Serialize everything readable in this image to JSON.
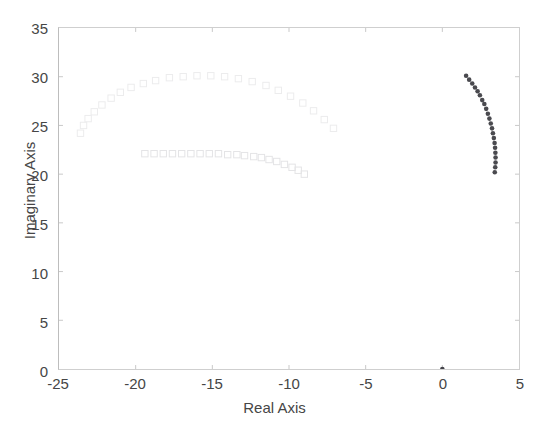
{
  "chart_data": {
    "type": "scatter",
    "title": "",
    "xlabel": "Real Axis",
    "ylabel": "Imaginary Axis",
    "xlim": [
      -25,
      5
    ],
    "ylim": [
      0,
      35
    ],
    "xticks": [
      -25,
      -20,
      -15,
      -10,
      -5,
      0,
      5
    ],
    "yticks": [
      0,
      5,
      10,
      15,
      20,
      25,
      30,
      35
    ],
    "xtick_labels": [
      "-25",
      "-20",
      "-15",
      "-10",
      "-5",
      "0",
      "5"
    ],
    "ytick_labels": [
      "0",
      "5",
      "10",
      "15",
      "20",
      "25",
      "30",
      "35"
    ],
    "grid": false,
    "legend": null,
    "background": "#ffffff",
    "frame_color": "#cfcfcf",
    "series": [
      {
        "name": "upper-locus-branch",
        "marker": "square-open",
        "color": "#ececed",
        "points": [
          [
            -23.6,
            24.2
          ],
          [
            -23.4,
            25.0
          ],
          [
            -23.1,
            25.7
          ],
          [
            -22.7,
            26.4
          ],
          [
            -22.2,
            27.1
          ],
          [
            -21.6,
            27.8
          ],
          [
            -21.0,
            28.4
          ],
          [
            -20.3,
            28.9
          ],
          [
            -19.5,
            29.3
          ],
          [
            -18.7,
            29.6
          ],
          [
            -17.8,
            29.9
          ],
          [
            -16.9,
            30.0
          ],
          [
            -16.0,
            30.1
          ],
          [
            -15.1,
            30.1
          ],
          [
            -14.2,
            30.0
          ],
          [
            -13.3,
            29.8
          ],
          [
            -12.4,
            29.5
          ],
          [
            -11.5,
            29.1
          ],
          [
            -10.7,
            28.6
          ],
          [
            -9.9,
            28.0
          ],
          [
            -9.1,
            27.3
          ],
          [
            -8.4,
            26.5
          ],
          [
            -7.7,
            25.6
          ],
          [
            -7.1,
            24.7
          ]
        ]
      },
      {
        "name": "lower-locus-branch",
        "marker": "square-open",
        "color": "#e4e4e6",
        "points": [
          [
            -19.4,
            22.1
          ],
          [
            -18.8,
            22.1
          ],
          [
            -18.2,
            22.1
          ],
          [
            -17.6,
            22.1
          ],
          [
            -17.0,
            22.1
          ],
          [
            -16.4,
            22.1
          ],
          [
            -15.8,
            22.1
          ],
          [
            -15.2,
            22.1
          ],
          [
            -14.6,
            22.1
          ],
          [
            -14.0,
            22.0
          ],
          [
            -13.4,
            22.0
          ],
          [
            -12.9,
            21.9
          ],
          [
            -12.3,
            21.8
          ],
          [
            -11.8,
            21.7
          ],
          [
            -11.3,
            21.5
          ],
          [
            -10.8,
            21.3
          ],
          [
            -10.3,
            21.0
          ],
          [
            -9.8,
            20.7
          ],
          [
            -9.4,
            20.4
          ],
          [
            -9.0,
            20.0
          ]
        ]
      },
      {
        "name": "right-locus-branch",
        "marker": "dot-filled",
        "color": "#4a4a4f",
        "points": [
          [
            1.55,
            30.1
          ],
          [
            1.75,
            29.7
          ],
          [
            1.95,
            29.3
          ],
          [
            2.13,
            28.9
          ],
          [
            2.3,
            28.5
          ],
          [
            2.45,
            28.1
          ],
          [
            2.6,
            27.6
          ],
          [
            2.74,
            27.2
          ],
          [
            2.86,
            26.7
          ],
          [
            2.97,
            26.2
          ],
          [
            3.07,
            25.7
          ],
          [
            3.16,
            25.2
          ],
          [
            3.24,
            24.7
          ],
          [
            3.3,
            24.2
          ],
          [
            3.36,
            23.7
          ],
          [
            3.41,
            23.2
          ],
          [
            3.44,
            22.7
          ],
          [
            3.46,
            22.2
          ],
          [
            3.47,
            21.7
          ],
          [
            3.47,
            21.2
          ],
          [
            3.45,
            20.7
          ],
          [
            3.42,
            20.2
          ]
        ]
      },
      {
        "name": "origin-pole",
        "marker": "dot-filled",
        "color": "#43434a",
        "points": [
          [
            0.0,
            0.0
          ]
        ]
      }
    ]
  },
  "axes": {
    "xlabel": "Real Axis",
    "ylabel": "Imaginary Axis"
  }
}
